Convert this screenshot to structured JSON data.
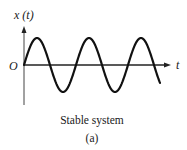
{
  "figure": {
    "y_label": "x (t)",
    "x_label": "t",
    "origin_label": "O",
    "caption": "Stable system",
    "sublabel": "(a)"
  },
  "chart_data": {
    "type": "line",
    "title": "Stable system",
    "subtitle": "(a)",
    "xlabel": "t",
    "ylabel": "x (t)",
    "origin": "O",
    "series": [
      {
        "name": "x(t)",
        "function": "A*sin(2*pi*t/T)",
        "amplitude": 1,
        "cycles_shown": 2.5
      }
    ],
    "grid": false,
    "legend": null
  },
  "colors": {
    "stroke": "#111111",
    "axis": "#333333",
    "background": "#ffffff"
  }
}
